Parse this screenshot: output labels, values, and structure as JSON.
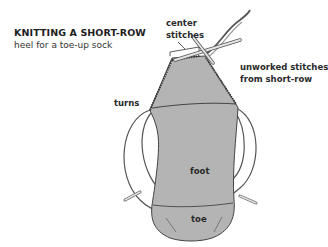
{
  "title": "KNITTING A SHORT-ROW",
  "subtitle": "heel for a toe-up sock",
  "labels": {
    "center_stitches_line1": "center",
    "center_stitches_line2": "stitches",
    "unworked_line1": "unworked stitches",
    "unworked_line2": "from short-row",
    "turns": "turns",
    "foot": "foot",
    "toe": "toe"
  },
  "colors": {
    "fabric": "#b4b4b4",
    "outline": "#444444",
    "needle": "#d8d8d8",
    "background": "#ffffff"
  }
}
